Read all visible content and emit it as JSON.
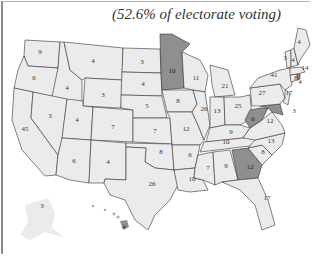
{
  "title": "(52.6% of electorate voting)",
  "colors": {
    "winner_shade": "#8f8f8f",
    "other_fill": "#ebebeb",
    "border": "#333333"
  },
  "states": [
    {
      "id": "WA",
      "votes": "9",
      "shaded": false
    },
    {
      "id": "OR",
      "votes": "6",
      "shaded": false
    },
    {
      "id": "CA",
      "votes": "45",
      "shaded": false
    },
    {
      "id": "ID",
      "votes": "4",
      "shaded": false
    },
    {
      "id": "NV",
      "votes": "3",
      "shaded": false
    },
    {
      "id": "MT",
      "votes": "4",
      "shaded": false
    },
    {
      "id": "WY",
      "votes": "3",
      "shaded": false
    },
    {
      "id": "UT",
      "votes": "4",
      "shaded": false
    },
    {
      "id": "AZ",
      "votes": "6",
      "shaded": false
    },
    {
      "id": "CO",
      "votes": "7",
      "shaded": false
    },
    {
      "id": "NM",
      "votes": "4",
      "shaded": false
    },
    {
      "id": "ND",
      "votes": "3",
      "shaded": false
    },
    {
      "id": "SD",
      "votes": "4",
      "shaded": false
    },
    {
      "id": "NE",
      "votes": "5",
      "shaded": false
    },
    {
      "id": "KS",
      "votes": "7",
      "shaded": false
    },
    {
      "id": "OK",
      "votes": "8",
      "shaded": false
    },
    {
      "id": "TX",
      "votes": "26",
      "shaded": false
    },
    {
      "id": "MN",
      "votes": "10",
      "shaded": true
    },
    {
      "id": "IA",
      "votes": "8",
      "shaded": false
    },
    {
      "id": "MO",
      "votes": "12",
      "shaded": false
    },
    {
      "id": "AR",
      "votes": "6",
      "shaded": false
    },
    {
      "id": "LA",
      "votes": "10",
      "shaded": false
    },
    {
      "id": "WI",
      "votes": "11",
      "shaded": false
    },
    {
      "id": "IL",
      "votes": "26",
      "shaded": false
    },
    {
      "id": "MI",
      "votes": "21",
      "shaded": false
    },
    {
      "id": "IN",
      "votes": "13",
      "shaded": false
    },
    {
      "id": "OH",
      "votes": "25",
      "shaded": false
    },
    {
      "id": "KY",
      "votes": "9",
      "shaded": false
    },
    {
      "id": "TN",
      "votes": "10",
      "shaded": false
    },
    {
      "id": "MS",
      "votes": "7",
      "shaded": false
    },
    {
      "id": "AL",
      "votes": "9",
      "shaded": false
    },
    {
      "id": "GA",
      "votes": "12",
      "shaded": true
    },
    {
      "id": "FL",
      "votes": "17",
      "shaded": false
    },
    {
      "id": "SC",
      "votes": "8",
      "shaded": false
    },
    {
      "id": "NC",
      "votes": "13",
      "shaded": false
    },
    {
      "id": "VA",
      "votes": "12",
      "shaded": false
    },
    {
      "id": "WV",
      "votes": "6",
      "shaded": true
    },
    {
      "id": "MD",
      "votes": "10",
      "shaded": true
    },
    {
      "id": "DC",
      "votes": "3",
      "shaded": true
    },
    {
      "id": "DE",
      "votes": "3",
      "shaded": false
    },
    {
      "id": "NJ",
      "votes": "17",
      "shaded": false
    },
    {
      "id": "PA",
      "votes": "27",
      "shaded": false
    },
    {
      "id": "NY",
      "votes": "41",
      "shaded": false
    },
    {
      "id": "CT",
      "votes": "8",
      "shaded": false
    },
    {
      "id": "RI",
      "votes": "4",
      "shaded": true
    },
    {
      "id": "MA",
      "votes": "14",
      "shaded": false
    },
    {
      "id": "VT",
      "votes": "3",
      "shaded": false
    },
    {
      "id": "NH",
      "votes": "4",
      "shaded": false
    },
    {
      "id": "ME",
      "votes": "4",
      "shaded": false
    },
    {
      "id": "AK",
      "votes": "3",
      "shaded": false
    },
    {
      "id": "HI",
      "votes": "4",
      "shaded": true
    }
  ]
}
